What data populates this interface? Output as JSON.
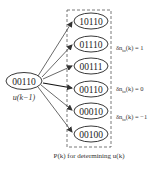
{
  "diagram": {
    "source_node": {
      "label": "00110",
      "caption": "u(k−1)"
    },
    "candidate_box": {
      "caption": "P(k) for determining u(k)",
      "nodes": [
        {
          "label": "10110"
        },
        {
          "label": "01110"
        },
        {
          "label": "00111"
        },
        {
          "label": "00110"
        },
        {
          "label": "00010"
        },
        {
          "label": "00100"
        }
      ]
    },
    "side_labels": [
      {
        "text": "δn",
        "sub": "to",
        "rest": "(k) = 1"
      },
      {
        "text": "δn",
        "sub": "to",
        "rest": "(k) = 0"
      },
      {
        "text": "δn",
        "sub": "to",
        "rest": "(k) = −1"
      }
    ],
    "colors": {
      "stroke": "#222222",
      "dashed_box": "#555555",
      "faded_label": "#888888"
    }
  }
}
